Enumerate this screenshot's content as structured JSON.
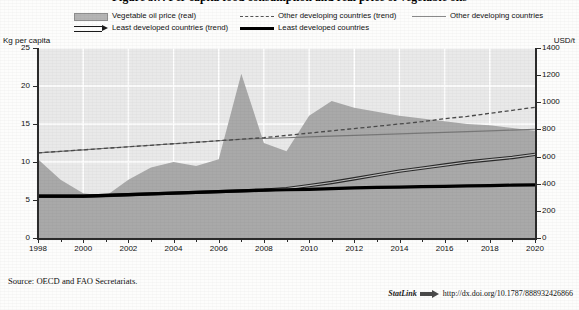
{
  "figure": {
    "title": "Figure 3.7. Per capita food consumption and real price of vegetable oils",
    "source_note": "Source:  OECD and FAO Secretariats.",
    "statlink_label": "StatLink",
    "statlink_icon": "statlink-arrow-icon",
    "statlink_url": "http://dx.doi.org/10.1787/888932426866"
  },
  "legend": {
    "items": [
      {
        "label": "Vegetable oil price (real)",
        "style": "area",
        "swatch": "area-swatch"
      },
      {
        "label": "Other developing countries (trend)",
        "style": "dashed",
        "swatch": "dashed-line-swatch"
      },
      {
        "label": "Other developing countries",
        "style": "thin",
        "swatch": "thin-line-swatch"
      },
      {
        "label": "Least developed countries (trend)",
        "style": "trend-arrow",
        "swatch": "trend-arrow-swatch"
      },
      {
        "label": "Least developed countries",
        "style": "thick",
        "swatch": "thick-line-swatch"
      }
    ]
  },
  "chart_data": {
    "type": "area",
    "title": "Figure 3.7. Per capita food consumption and real price of vegetable oils",
    "xlabel": "",
    "ylabel": "Kg per capita",
    "ylabel_right": "USD/t",
    "ylim": [
      0,
      25
    ],
    "ylim_right": [
      0,
      1400
    ],
    "yticks": [
      0,
      5,
      10,
      15,
      20,
      25
    ],
    "yticks_right": [
      0,
      200,
      400,
      600,
      800,
      1000,
      1200,
      1400
    ],
    "xlim": [
      1998,
      2020
    ],
    "xticks": [
      1998,
      2000,
      2002,
      2004,
      2006,
      2008,
      2010,
      2012,
      2014,
      2016,
      2018,
      2020
    ],
    "minor_xticks_every": 1,
    "grid": true,
    "legend_position": "above-plot",
    "x": [
      1998,
      1999,
      2000,
      2001,
      2002,
      2003,
      2004,
      2005,
      2006,
      2007,
      2008,
      2009,
      2010,
      2011,
      2012,
      2013,
      2014,
      2015,
      2016,
      2017,
      2018,
      2019,
      2020
    ],
    "series": [
      {
        "name": "Vegetable oil price (real)",
        "axis": "right",
        "units": "USD/t",
        "type": "area",
        "color": "#a8a8a8",
        "values": [
          580,
          430,
          330,
          310,
          430,
          520,
          560,
          530,
          580,
          1210,
          700,
          640,
          900,
          1010,
          960,
          930,
          900,
          880,
          860,
          840,
          830,
          810,
          790
        ]
      },
      {
        "name": "Other developing countries",
        "axis": "left",
        "units": "Kg per capita",
        "type": "line",
        "color": "#7d7d7d",
        "values": [
          11.2,
          11.4,
          11.6,
          11.8,
          12.0,
          12.2,
          12.4,
          12.6,
          12.8,
          13.0,
          13.1,
          13.2,
          13.3,
          13.4,
          13.5,
          13.6,
          13.7,
          13.8,
          13.9,
          14.0,
          14.1,
          14.2,
          14.3
        ]
      },
      {
        "name": "Other developing countries (trend)",
        "axis": "left",
        "units": "Kg per capita",
        "type": "dashed-line",
        "color": "#4a4a4a",
        "values": [
          11.2,
          11.4,
          11.6,
          11.8,
          12.0,
          12.2,
          12.4,
          12.6,
          12.8,
          13.0,
          13.2,
          13.5,
          13.8,
          14.1,
          14.4,
          14.7,
          15.0,
          15.3,
          15.7,
          16.0,
          16.4,
          16.8,
          17.2
        ]
      },
      {
        "name": "Least developed countries",
        "axis": "left",
        "units": "Kg per capita",
        "type": "thick-line",
        "color": "#000000",
        "values": [
          5.5,
          5.5,
          5.5,
          5.6,
          5.7,
          5.8,
          5.9,
          6.0,
          6.1,
          6.2,
          6.3,
          6.35,
          6.4,
          6.5,
          6.6,
          6.65,
          6.7,
          6.75,
          6.8,
          6.85,
          6.9,
          6.95,
          7.0
        ]
      },
      {
        "name": "Least developed countries (trend)",
        "axis": "left",
        "units": "Kg per capita",
        "type": "trend-line",
        "color": "#2a2a2a",
        "values": [
          5.5,
          5.5,
          5.5,
          5.6,
          5.7,
          5.8,
          5.9,
          6.0,
          6.1,
          6.2,
          6.3,
          6.5,
          6.9,
          7.3,
          7.8,
          8.3,
          8.8,
          9.2,
          9.6,
          10.0,
          10.3,
          10.6,
          11.0
        ]
      }
    ]
  }
}
